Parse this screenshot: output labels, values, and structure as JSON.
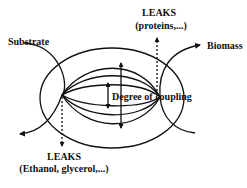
{
  "diagram": {
    "labels": {
      "substrate": "Substrate",
      "biomass": "Biomass",
      "degree_of_coupling": "Degree of coupling",
      "leaks_top_title": "LEAKS",
      "leaks_top_detail": "(proteins,...)",
      "leaks_bottom_title": "LEAKS",
      "leaks_bottom_detail": "(Ethanol, glycerol,...)"
    },
    "colors": {
      "stroke": "#111111",
      "background": "#ffffff"
    }
  }
}
